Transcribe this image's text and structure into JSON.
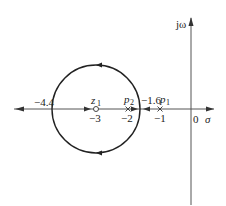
{
  "diagram": {
    "type": "root-locus",
    "axes": {
      "real_label": "σ",
      "imag_label": "jω",
      "origin_label": "0"
    },
    "points": {
      "zero": {
        "name": "z",
        "sub": "1",
        "value_label": "−3"
      },
      "pole2": {
        "name": "p",
        "sub": "2",
        "value_label": "−2"
      },
      "pole1": {
        "name": "p",
        "sub": "1",
        "value_label": "−1"
      }
    },
    "breakpoints": {
      "left": "−4.4",
      "right": "−1.6"
    },
    "circle": {
      "center": -3,
      "radius": 1.4
    },
    "colors": {
      "line": "#222222",
      "axis": "#555555"
    }
  }
}
